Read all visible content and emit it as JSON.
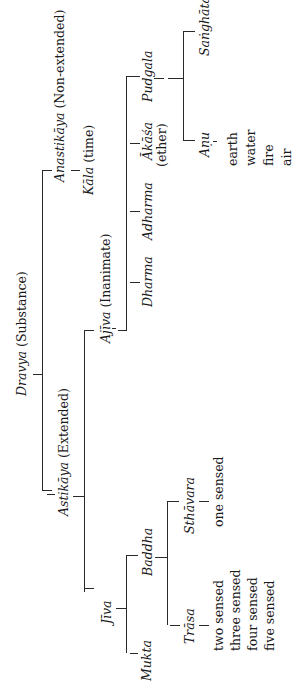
{
  "diagram": {
    "type": "tree",
    "orientation": "rotated-90-ccw",
    "root": {
      "term": "Dravya",
      "gloss": "(Substance)",
      "children": [
        {
          "term": "Astikāya",
          "gloss": "(Extended)",
          "children": [
            {
              "term": "Jīva",
              "children": [
                {
                  "term": "Mukta"
                },
                {
                  "term": "Baddha",
                  "children": [
                    {
                      "term": "Trāsa",
                      "items": [
                        "two sensed",
                        "three sensed",
                        "four sensed",
                        "five sensed"
                      ]
                    },
                    {
                      "term": "Sthāvara",
                      "items": [
                        "one sensed"
                      ]
                    }
                  ]
                }
              ]
            },
            {
              "term": "Ajīva",
              "gloss": "(Inanimate)",
              "children": [
                {
                  "term": "Dharma"
                },
                {
                  "term": "Adharma"
                },
                {
                  "term": "Ākāśa",
                  "gloss": "(ether)"
                },
                {
                  "term": "Pudgala",
                  "children": [
                    {
                      "term": "Aṇu",
                      "items": [
                        "earth",
                        "water",
                        "fire",
                        "air"
                      ]
                    },
                    {
                      "term": "Saṅghāta"
                    }
                  ]
                }
              ]
            }
          ]
        },
        {
          "term": "Anastikāya",
          "gloss": "(Non-extended)",
          "children": [
            {
              "term": "Kāla",
              "gloss": "(time)"
            }
          ]
        }
      ]
    }
  },
  "labels": {
    "dravya": "Dravya",
    "dravya_gloss": " (Substance)",
    "astikaya": "Astikāya",
    "astikaya_gloss": " (Extended)",
    "anastikaya": "Anastikāya",
    "anastikaya_gloss": " (Non-extended)",
    "kala": "Kāla",
    "kala_gloss": " (time)",
    "ajiva": "Ajīva",
    "ajiva_gloss": " (Inanimate)",
    "dharma": "Dharma",
    "adharma": "Adharma",
    "akasa": "Ākāśa",
    "akasa_gloss": "(ether)",
    "pudgala": "Pudgala",
    "sanghata": "Saṅghāta",
    "anu": "Aṇu",
    "anu_items": [
      "earth",
      "water",
      "fire",
      "air"
    ],
    "jiva": "Jīva",
    "mukta": "Mukta",
    "baddha": "Baddha",
    "sthavara": "Sthāvara",
    "sthavara_items": [
      "one sensed"
    ],
    "trasa": "Trāsa",
    "trasa_items": [
      "two sensed",
      "three sensed",
      "four sensed",
      "five sensed"
    ]
  }
}
